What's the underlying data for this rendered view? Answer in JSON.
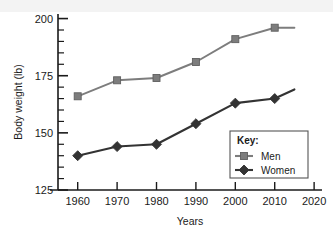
{
  "chart_data": {
    "type": "line",
    "title": "",
    "xlabel": "Years",
    "ylabel": "Body weight (lb)",
    "xlim": [
      1955,
      2022
    ],
    "ylim": [
      125,
      202
    ],
    "xticks": [
      1960,
      1970,
      1980,
      1990,
      2000,
      2010,
      2020
    ],
    "yticks": [
      125,
      150,
      175,
      200
    ],
    "y_minor_step": 5,
    "grid": false,
    "legend_position": "lower-right-inside",
    "legend_title": "Key:",
    "x": [
      1960,
      1970,
      1980,
      1990,
      2000,
      2010,
      2015
    ],
    "series": [
      {
        "name": "Men",
        "color": "#7d7d7d",
        "marker": "square",
        "values": [
          166,
          173,
          174,
          181,
          191,
          196,
          196
        ]
      },
      {
        "name": "Women",
        "color": "#333333",
        "marker": "diamond",
        "values": [
          140,
          144,
          145,
          154,
          163,
          165,
          169
        ]
      }
    ]
  },
  "axes": {
    "y_title": "Body weight (lb)",
    "x_title": "Years",
    "y_tick_labels": [
      "200",
      "175",
      "150",
      "125"
    ],
    "x_tick_labels": [
      "1960",
      "1970",
      "1980",
      "1990",
      "2000",
      "2010",
      "2020"
    ]
  },
  "legend": {
    "title": "Key:",
    "entries": [
      {
        "label": "Men",
        "marker": "square-marker"
      },
      {
        "label": "Women",
        "marker": "diamond-marker"
      }
    ]
  },
  "colors": {
    "men": "#7d7d7d",
    "women": "#333333",
    "axis": "#1a1a1a",
    "background": "#ffffff"
  }
}
